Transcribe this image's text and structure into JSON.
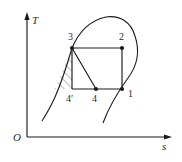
{
  "figure": {
    "kind": "thermodynamic-Ts-diagram",
    "background_color": "#ffffff",
    "line_color": "#1a1a1a"
  },
  "axes": {
    "y_label": "T",
    "x_label": "s",
    "origin_label": "O",
    "y_axis": {
      "x": 27,
      "y_top": 16,
      "y_bottom": 137
    },
    "x_axis": {
      "y": 137,
      "x_left": 27,
      "x_right": 168
    }
  },
  "states": [
    {
      "id": "s1",
      "label": "1",
      "x": 122,
      "y": 89,
      "label_x": 128,
      "label_y": 97,
      "dot": true
    },
    {
      "id": "s2",
      "label": "2",
      "x": 122,
      "y": 48,
      "label_x": 119,
      "label_y": 40,
      "dot": true
    },
    {
      "id": "s3",
      "label": "3",
      "x": 72,
      "y": 48,
      "label_x": 68,
      "label_y": 40,
      "dot": true
    },
    {
      "id": "s4",
      "label": "4",
      "x": 96,
      "y": 89,
      "label_x": 92,
      "label_y": 102,
      "dot": true
    },
    {
      "id": "s4p",
      "label": "4′",
      "x": 72,
      "y": 89,
      "label_x": 66,
      "label_y": 102,
      "dot": false
    }
  ],
  "cycle_paths": [
    {
      "name": "line-3-to-2",
      "d": "M 72 48 L 122 48"
    },
    {
      "name": "line-2-to-1",
      "d": "M 122 48 L 122 89"
    },
    {
      "name": "line-1-to-4prime",
      "d": "M 122 89 L 72 89"
    },
    {
      "name": "line-3-to-4",
      "d": "M 72 48 L 96 89"
    },
    {
      "name": "line-3-to-4prime",
      "d": "M 72 48 L 72 89"
    }
  ],
  "saturation_curve": {
    "name": "saturation-dome",
    "d": "M 42 121 C 50 108, 58 96, 72 48 C 80 29, 92 20, 106 17 C 120 15, 131 22, 135 36 C 140 51, 137 66, 128 78 C 120 89, 110 104, 103 123"
  },
  "hatch_region": {
    "name": "hatched-area-3-4prime",
    "outline": "M 72 48 L 72 89 L 54 89 C 60 78, 66 62, 72 48 Z",
    "hatch_angle_deg": 45,
    "hatch_spacing_px": 4.2
  }
}
